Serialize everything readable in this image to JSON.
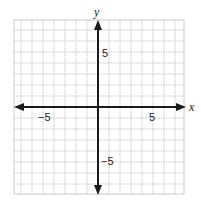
{
  "chart_data": {
    "type": "scatter",
    "title": "",
    "xlabel": "x",
    "ylabel": "y",
    "xlim": [
      -7.5,
      7.75
    ],
    "ylim": [
      -7.8,
      7.9
    ],
    "grid": true,
    "grid_step": 1,
    "tick_labels": {
      "x": [
        {
          "value": -5,
          "label": "−5"
        },
        {
          "value": 5,
          "label": "5"
        }
      ],
      "y": [
        {
          "value": 5,
          "label": "5"
        },
        {
          "value": -5,
          "label": "−5"
        }
      ]
    },
    "series": [],
    "axes_arrows": true
  },
  "labels": {
    "x_axis": "x",
    "y_axis": "y",
    "x_neg5": "−5",
    "x_pos5": "5",
    "y_pos5": "5",
    "y_neg5": "−5"
  },
  "colors": {
    "grid": "#bdbdbd",
    "axis": "#1a1a1a",
    "background": "#ffffff"
  }
}
